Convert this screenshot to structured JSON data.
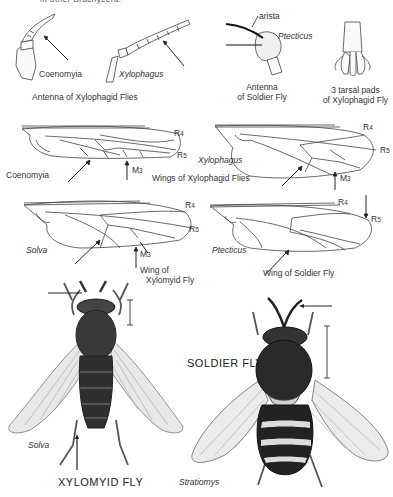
{
  "page": {
    "top_cut_text": "in other Brachycera.",
    "sections": {
      "antennae": {
        "caption_xylophagid": "Antenna of Xylophagid Flies",
        "genus_1": "Coenomyia",
        "genus_2": "Xylophagus",
        "soldier_caption_line1": "Antenna",
        "soldier_caption_line2": "of Soldier Fly",
        "arista_label": "arista",
        "soldier_genus": "Ptecticus",
        "tarsal_caption_line1": "3 tarsal pads",
        "tarsal_caption_line2": "of Xylophagid Fly"
      },
      "wings": {
        "coenomyia_label": "Coenomyia",
        "xylophagus_label": "Xylophagus",
        "xylophagid_caption": "Wings of Xylophagid Flies",
        "solva_label": "Solva",
        "xylomyid_caption_line1": "Wing of",
        "xylomyid_caption_line2": "Xylomyid Fly",
        "ptecticus_label": "Ptecticus",
        "soldier_caption": "Wing of Soldier Fly",
        "vein_R4": "R",
        "vein_R4_sub": "4",
        "vein_R5": "R",
        "vein_R5_sub": "5",
        "vein_M3": "M",
        "vein_M3_sub": "3"
      },
      "flies": {
        "xylomyid_genus": "Solva",
        "xylomyid_title": "XYLOMYID FLY",
        "soldier_genus": "Stratiomys",
        "soldier_title": "SOLDIER FLY"
      }
    }
  }
}
